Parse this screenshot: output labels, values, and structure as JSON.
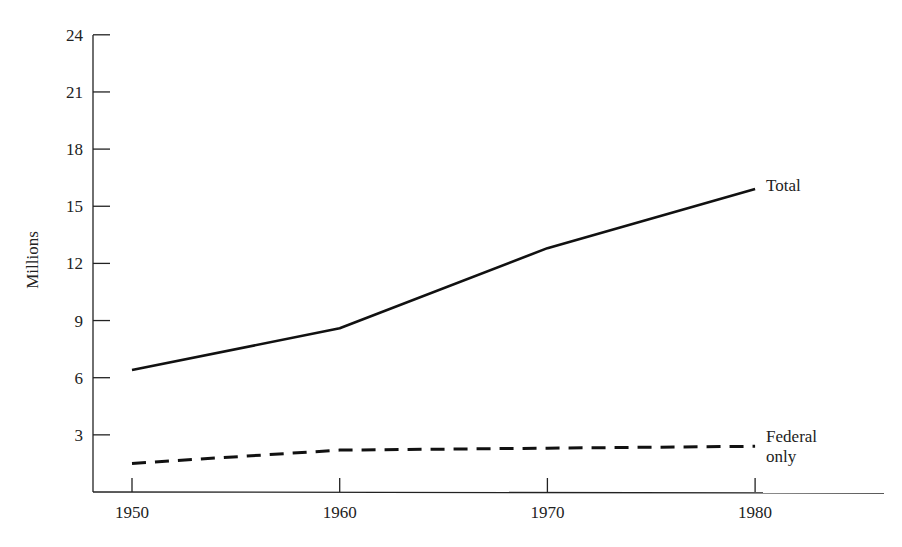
{
  "chart_data": {
    "type": "line",
    "title": "",
    "xlabel": "",
    "ylabel": "Millions",
    "x": [
      1950,
      1960,
      1970,
      1980
    ],
    "x_tick_labels": [
      "1950",
      "1960",
      "1970",
      "1980"
    ],
    "y_ticks": [
      3,
      6,
      9,
      12,
      15,
      18,
      21,
      24
    ],
    "y_tick_labels": [
      "3",
      "6",
      "9",
      "12",
      "15",
      "18",
      "21",
      "24"
    ],
    "ylim": [
      0,
      24
    ],
    "grid": false,
    "legend_position": "inline-right",
    "series": [
      {
        "name": "Total",
        "label": "Total",
        "style": "solid",
        "values": [
          6.4,
          8.6,
          12.8,
          15.9
        ]
      },
      {
        "name": "Federal only",
        "label_lines": [
          "Federal",
          "only"
        ],
        "style": "dashed",
        "values": [
          1.5,
          2.2,
          2.3,
          2.4
        ]
      }
    ]
  },
  "colors": {
    "line": "#111111",
    "axis": "#222222",
    "background": "#ffffff"
  }
}
